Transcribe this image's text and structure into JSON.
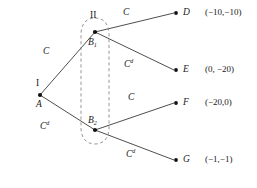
{
  "figure": {
    "type": "extensive-form-game-tree",
    "players": [
      {
        "id": "I",
        "label": "I"
      },
      {
        "id": "II",
        "label": "II"
      }
    ],
    "nodes": [
      {
        "id": "A",
        "label": "A",
        "player_label": "I",
        "x": 40,
        "y": 95,
        "kind": "decision"
      },
      {
        "id": "B1",
        "label": "B",
        "subscript": "1",
        "x": 95,
        "y": 32,
        "kind": "decision"
      },
      {
        "id": "B2",
        "label": "B",
        "subscript": "2",
        "x": 95,
        "y": 130,
        "kind": "decision"
      },
      {
        "id": "D",
        "label": "D",
        "x": 178,
        "y": 13,
        "kind": "terminal"
      },
      {
        "id": "E",
        "label": "E",
        "x": 178,
        "y": 70,
        "kind": "terminal"
      },
      {
        "id": "F",
        "label": "F",
        "x": 178,
        "y": 103,
        "kind": "terminal"
      },
      {
        "id": "G",
        "label": "G",
        "x": 178,
        "y": 160,
        "kind": "terminal"
      }
    ],
    "edges": [
      {
        "from": "A",
        "to": "B1",
        "action": "C",
        "action_sup": ""
      },
      {
        "from": "A",
        "to": "B2",
        "action": "C",
        "action_sup": "d"
      },
      {
        "from": "B1",
        "to": "D",
        "action": "C",
        "action_sup": ""
      },
      {
        "from": "B1",
        "to": "E",
        "action": "C",
        "action_sup": "d"
      },
      {
        "from": "B2",
        "to": "F",
        "action": "C",
        "action_sup": ""
      },
      {
        "from": "B2",
        "to": "G",
        "action": "C",
        "action_sup": "d"
      }
    ],
    "information_set": {
      "player_label": "II",
      "members": [
        "B1",
        "B2"
      ],
      "shape": "dashed-oval"
    },
    "labels": {
      "player_I": "I",
      "player_II": "II",
      "node_A": "A",
      "node_B1_base": "B",
      "node_B1_sub": "1",
      "node_B2_base": "B",
      "node_B2_sub": "2",
      "node_D": "D",
      "node_E": "E",
      "node_F": "F",
      "node_G": "G",
      "action_C": "C",
      "action_Cd_base": "C",
      "action_Cd_sup": "d"
    },
    "payoffs": [
      {
        "node": "D",
        "text": "(−10,−10)",
        "values": [
          -10,
          -10
        ]
      },
      {
        "node": "E",
        "text": "(0, −20)",
        "values": [
          0,
          -20
        ]
      },
      {
        "node": "F",
        "text": "(−20,0)",
        "values": [
          -20,
          0
        ]
      },
      {
        "node": "G",
        "text": "(−1,−1)",
        "values": [
          -1,
          -1
        ]
      }
    ],
    "colors": {
      "edge": "#3a3a3a",
      "infoset": "#8a8a8a",
      "node": "#111111",
      "text": "#1a1a1a",
      "background": "#ffffff"
    }
  }
}
